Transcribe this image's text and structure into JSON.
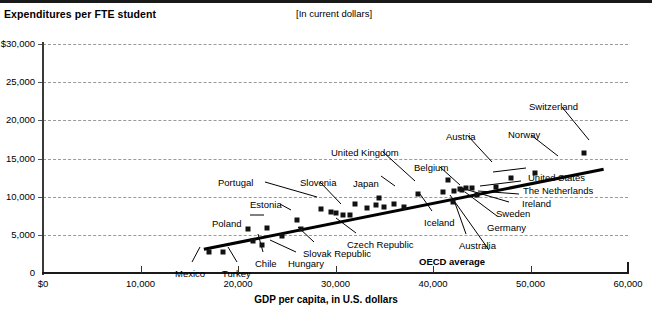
{
  "header": {
    "title": "Expenditures per FTE student",
    "units_note": "[In current dollars]"
  },
  "chart_data": {
    "type": "scatter",
    "title": "Expenditures per FTE student",
    "subtitle": "[In current dollars]",
    "xlabel": "GDP per capita, in U.S. dollars",
    "ylabel": "Expenditures per FTE student",
    "xlim": [
      0,
      60000
    ],
    "ylim": [
      0,
      30000
    ],
    "xticks": [
      0,
      10000,
      20000,
      30000,
      40000,
      50000,
      60000
    ],
    "xtick_labels": [
      "$0",
      "10,000",
      "20,000",
      "30,000",
      "40,000",
      "50,000",
      "60,000"
    ],
    "yticks": [
      0,
      5000,
      10000,
      15000,
      20000,
      25000,
      30000
    ],
    "ytick_labels": [
      "0",
      "5,000",
      "10,000",
      "15,000",
      "20,000",
      "25,000",
      "30,000"
    ],
    "ytick_labels_display": [
      "0",
      "5,000",
      "10,000",
      "15,000",
      "20,000",
      "25,000",
      "$30,000"
    ],
    "grid": "horizontal-dashed",
    "legend": "none",
    "trendline": {
      "label": "OECD average",
      "x_start": 16500,
      "y_start": 3100,
      "x_end": 57500,
      "y_end": 13600
    },
    "points": [
      {
        "name": "Mexico",
        "x": 17000,
        "y": 2800,
        "label_x": 175,
        "label_y": 268,
        "leader": [
          [
            192,
            262
          ],
          [
            200,
            247
          ]
        ]
      },
      {
        "name": "Turkey",
        "x": 18500,
        "y": 2800,
        "label_x": 222,
        "label_y": 268,
        "leader": [
          [
            237,
            262
          ],
          [
            228,
            247
          ]
        ]
      },
      {
        "name": "Chile",
        "x": 21500,
        "y": 4200,
        "label_x": 255,
        "label_y": 258,
        "leader": [
          [
            263,
            252
          ],
          [
            258,
            234
          ]
        ]
      },
      {
        "name": "Hungary",
        "x": 22500,
        "y": 3700,
        "label_x": 288,
        "label_y": 258,
        "leader": [
          [
            296,
            252
          ],
          [
            270,
            240
          ]
        ]
      },
      {
        "name": "Poland",
        "x": 21000,
        "y": 5700,
        "label_x": 212,
        "label_y": 218,
        "leader": [
          [
            250,
            215
          ],
          [
            264,
            215
          ]
        ]
      },
      {
        "name": "Estonia",
        "x": 23000,
        "y": 5900,
        "label_x": 250,
        "label_y": 199,
        "leader": [
          [
            280,
            204
          ],
          [
            291,
            210
          ]
        ]
      },
      {
        "name": "Slovak Republic",
        "x": 24500,
        "y": 4900,
        "label_x": 303,
        "label_y": 248,
        "leader": [
          [
            314,
            242
          ],
          [
            298,
            227
          ]
        ]
      },
      {
        "name": "Portugal",
        "x": 26000,
        "y": 7000,
        "label_x": 218,
        "label_y": 177,
        "leader": [
          [
            265,
            182
          ],
          [
            317,
            197
          ]
        ]
      },
      {
        "name": "Czech Republic",
        "x": 26500,
        "y": 5800,
        "label_x": 347,
        "label_y": 239,
        "leader": [
          [
            356,
            233
          ],
          [
            336,
            218
          ]
        ]
      },
      {
        "name": "Slovenia",
        "x": 28500,
        "y": 8400,
        "label_x": 300,
        "label_y": 177,
        "leader": [
          [
            320,
            182
          ],
          [
            341,
            204
          ]
        ]
      },
      {
        "name": "Japan",
        "x": 32000,
        "y": 9000,
        "label_x": 353,
        "label_y": 178,
        "leader": [
          [
            381,
            176
          ],
          [
            395,
            186
          ]
        ]
      },
      {
        "name": "United Kingdom",
        "x": 34500,
        "y": 9800,
        "label_x": 331,
        "label_y": 147,
        "leader": [
          [
            383,
            152
          ],
          [
            415,
            181
          ]
        ]
      },
      {
        "name": "Iceland",
        "x": 37000,
        "y": 8600,
        "label_x": 424,
        "label_y": 217,
        "leader": [
          [
            432,
            211
          ],
          [
            420,
            194
          ]
        ]
      },
      {
        "name": "Belgium",
        "x": 38500,
        "y": 10400,
        "label_x": 414,
        "label_y": 162,
        "leader": [
          [
            440,
            167
          ],
          [
            460,
            185
          ]
        ]
      },
      {
        "name": "Austria",
        "x": 41500,
        "y": 12200,
        "label_x": 446,
        "label_y": 131,
        "leader": [
          [
            468,
            136
          ],
          [
            492,
            162
          ]
        ]
      },
      {
        "name": "OECD average",
        "x": 35500,
        "y": 9500,
        "label_x": 419,
        "label_y": 256,
        "leader": [
          [
            489,
            250
          ],
          [
            450,
            195
          ]
        ]
      },
      {
        "name": "Australia",
        "x": 42000,
        "y": 9300,
        "label_x": 459,
        "label_y": 240,
        "leader": [
          [
            466,
            234
          ],
          [
            455,
            203
          ]
        ]
      },
      {
        "name": "Germany",
        "x": 43000,
        "y": 10900,
        "label_x": 487,
        "label_y": 222,
        "leader": [
          [
            497,
            216
          ],
          [
            465,
            192
          ]
        ]
      },
      {
        "name": "Sweden",
        "x": 44000,
        "y": 11100,
        "label_x": 496,
        "label_y": 208,
        "leader": [
          [
            509,
            202
          ],
          [
            468,
            190
          ]
        ]
      },
      {
        "name": "Ireland",
        "x": 44500,
        "y": 10200,
        "label_x": 522,
        "label_y": 198,
        "leader": [
          [
            519,
            194
          ],
          [
            478,
            191
          ]
        ]
      },
      {
        "name": "The Netherlands",
        "x": 46500,
        "y": 11300,
        "label_x": 523,
        "label_y": 185,
        "leader": [
          [
            521,
            181
          ],
          [
            480,
            186
          ]
        ]
      },
      {
        "name": "United States",
        "x": 48000,
        "y": 12500,
        "label_x": 528,
        "label_y": 172,
        "leader": [
          [
            526,
            168
          ],
          [
            493,
            172
          ]
        ]
      },
      {
        "name": "Norway",
        "x": 50500,
        "y": 13100,
        "label_x": 508,
        "label_y": 129,
        "leader": [
          [
            531,
            135
          ],
          [
            558,
            156
          ]
        ]
      },
      {
        "name": "Switzerland",
        "x": 55500,
        "y": 15700,
        "label_x": 529,
        "label_y": 101,
        "leader": [
          [
            562,
            107
          ],
          [
            589,
            140
          ]
        ]
      }
    ],
    "cluster_points": [
      {
        "x": 29500,
        "y": 8000
      },
      {
        "x": 30000,
        "y": 7900
      },
      {
        "x": 30800,
        "y": 7600
      },
      {
        "x": 31500,
        "y": 7600
      },
      {
        "x": 33200,
        "y": 8500
      },
      {
        "x": 34200,
        "y": 8900
      },
      {
        "x": 35000,
        "y": 8700
      },
      {
        "x": 36000,
        "y": 9100
      },
      {
        "x": 41000,
        "y": 10600
      },
      {
        "x": 42200,
        "y": 10800
      },
      {
        "x": 42800,
        "y": 11000
      },
      {
        "x": 43400,
        "y": 11200
      }
    ]
  }
}
